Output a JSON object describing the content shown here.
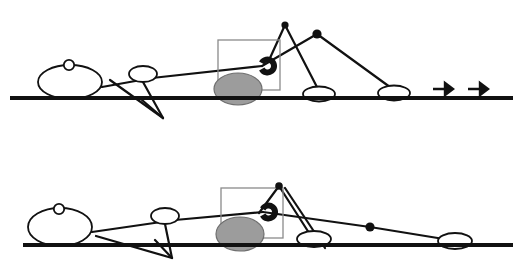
{
  "page": {
    "background_color": "#ffffff",
    "width": 522,
    "height": 270,
    "panel_count": 2
  },
  "palette": {
    "ink": "#111111",
    "wheel_fill": "#9c9c9c",
    "wheel_stroke": "#6f6f6f",
    "box_stroke": "#8a8a8a",
    "shape_fill": "#ffffff"
  },
  "panels": [
    {
      "id": "panel-top",
      "label": "Upper pose frame",
      "offset_y": 0,
      "ground": {
        "x1": 10,
        "y1": 98,
        "x2": 513,
        "y2": 98,
        "stroke_width": 4
      },
      "head_ellipse": {
        "cx": 70,
        "cy": 82,
        "rx": 32,
        "ry": 17
      },
      "head_knob": {
        "cx": 69,
        "cy": 65,
        "r": 5.2
      },
      "mid_ellipse": {
        "cx": 143,
        "cy": 74,
        "rx": 14,
        "ry": 8
      },
      "box": {
        "x": 218,
        "y": 40,
        "width": 62,
        "height": 50
      },
      "wheel": {
        "cx": 238,
        "cy": 89,
        "rx": 24,
        "ry": 16
      },
      "annulus": {
        "cx": 256,
        "cy": 66,
        "r": 6.5,
        "gap_deg": 55,
        "stroke_width": 6
      },
      "feet": [
        {
          "cx": 319,
          "cy": 94,
          "rx": 16,
          "ry": 7.5
        },
        {
          "cx": 394,
          "cy": 93,
          "rx": 16,
          "ry": 7.5
        }
      ],
      "joints": [
        {
          "cx": 285,
          "cy": 25,
          "r": 3.6
        },
        {
          "cx": 317,
          "cy": 34,
          "r": 4.6
        }
      ],
      "links": [
        {
          "name": "torso-rod",
          "points": "102,87 152,78 262,66"
        },
        {
          "name": "upper-arm",
          "points": "262,66 317,34"
        },
        {
          "name": "forearm",
          "points": "317,34 394,90"
        },
        {
          "name": "thigh",
          "points": "285,25 319,91"
        },
        {
          "name": "shin",
          "points": "285,25 270,58"
        },
        {
          "name": "lower-leg-a",
          "points": "110,80 163,118"
        },
        {
          "name": "lower-leg-b",
          "points": "143,82 163,118"
        },
        {
          "name": "foot-spur",
          "points": "163,118 142,100"
        }
      ],
      "arrows": [
        {
          "name": "motion-arrow-1",
          "x": 433,
          "y": 89,
          "length": 20
        },
        {
          "name": "motion-arrow-2",
          "x": 468,
          "y": 89,
          "length": 20
        }
      ]
    },
    {
      "id": "panel-bottom",
      "label": "Lower pose frame",
      "offset_y": 135,
      "ground": {
        "x1": 23,
        "y1": 245,
        "x2": 513,
        "y2": 245,
        "stroke_width": 4
      },
      "head_ellipse": {
        "cx": 60,
        "cy": 227,
        "rx": 32,
        "ry": 19
      },
      "head_knob": {
        "cx": 59,
        "cy": 209,
        "r": 5.2
      },
      "mid_ellipse": {
        "cx": 165,
        "cy": 216,
        "rx": 14,
        "ry": 8
      },
      "box": {
        "x": 221,
        "y": 188,
        "width": 62,
        "height": 50
      },
      "wheel": {
        "cx": 240,
        "cy": 234,
        "rx": 24,
        "ry": 17
      },
      "annulus": {
        "cx": 257,
        "cy": 212,
        "r": 6.5,
        "gap_deg": 55,
        "stroke_width": 6
      },
      "feet": [
        {
          "cx": 314,
          "cy": 239,
          "rx": 17,
          "ry": 8
        },
        {
          "cx": 455,
          "cy": 241,
          "rx": 17,
          "ry": 8
        }
      ],
      "joints": [
        {
          "cx": 279,
          "cy": 186,
          "r": 3.8
        },
        {
          "cx": 370,
          "cy": 227,
          "r": 4.6
        }
      ],
      "links": [
        {
          "name": "torso-rod",
          "points": "92,232 175,220 263,212"
        },
        {
          "name": "long-arm",
          "points": "263,212 370,227 450,240"
        },
        {
          "name": "thigh",
          "points": "279,186 311,236"
        },
        {
          "name": "shin",
          "points": "279,186 259,213"
        },
        {
          "name": "upper-brace",
          "points": "285,188 325,248"
        },
        {
          "name": "lower-leg-a",
          "points": "96,236 172,258"
        },
        {
          "name": "lower-leg-b",
          "points": "165,224 172,258"
        },
        {
          "name": "foot-spur",
          "points": "172,258 155,240"
        }
      ],
      "arrows": []
    }
  ],
  "legend": {
    "wheel_label": "wheel",
    "head_label": "body",
    "arrow_label": "direction of travel"
  }
}
